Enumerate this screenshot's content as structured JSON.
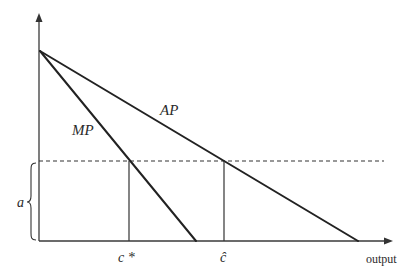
{
  "diagram": {
    "type": "economics average/marginal product diagram",
    "axes": {
      "x_label": "output",
      "y_label": ""
    },
    "curves": [
      {
        "name": "AP",
        "label": "AP",
        "description": "average product line, intercept top of y-axis, crosses dashed level at c-hat"
      },
      {
        "name": "MP",
        "label": "MP",
        "description": "marginal product line, steeper, crosses dashed level at c*"
      }
    ],
    "markers": {
      "c_star": "c *",
      "c_hat": "ĉ"
    },
    "brace_label": "a",
    "colors": {
      "line": "#222222",
      "background": "#ffffff"
    }
  }
}
